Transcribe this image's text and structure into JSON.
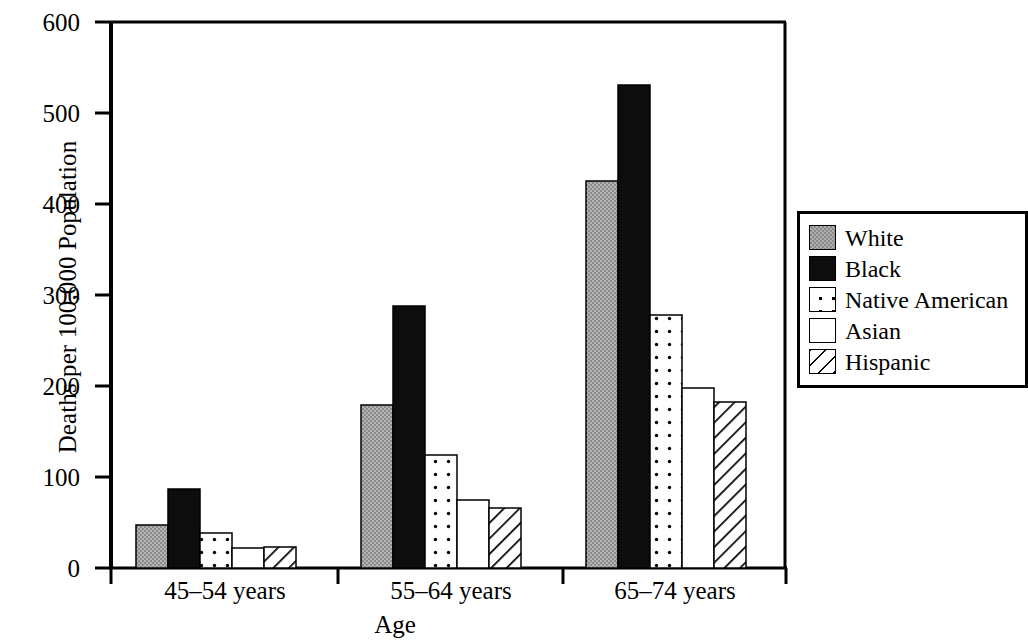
{
  "chart_data": {
    "type": "bar",
    "title": "",
    "xlabel": "Age",
    "ylabel": "Deaths per 100,000 Population",
    "categories": [
      "45–54 years",
      "55–64 years",
      "65–74 years"
    ],
    "ylim": [
      0,
      600
    ],
    "yticks": [
      0,
      100,
      200,
      300,
      400,
      500,
      600
    ],
    "ytick_labels": [
      "0",
      "100",
      "200",
      "300",
      "400",
      "500",
      "600"
    ],
    "grid": false,
    "legend_position": "right",
    "series": [
      {
        "name": "White",
        "pattern": "solid-gray",
        "color": "#8a8a8a",
        "values": [
          47,
          179,
          425
        ]
      },
      {
        "name": "Black",
        "pattern": "solid-black",
        "color": "#0d0d0d",
        "values": [
          87,
          288,
          531
        ]
      },
      {
        "name": "Native American",
        "pattern": "dotted",
        "color": "#ffffff",
        "values": [
          38,
          124,
          278
        ]
      },
      {
        "name": "Asian",
        "pattern": "empty",
        "color": "#ffffff",
        "values": [
          22,
          75,
          198
        ]
      },
      {
        "name": "Hispanic",
        "pattern": "diagonal-hatch",
        "color": "#ffffff",
        "values": [
          23,
          66,
          182
        ]
      }
    ]
  },
  "legend": {
    "items": [
      {
        "label": "White"
      },
      {
        "label": "Black"
      },
      {
        "label": "Native American"
      },
      {
        "label": "Asian"
      },
      {
        "label": "Hispanic"
      }
    ]
  },
  "axes": {
    "y_title": "Deaths per 100,000 Population",
    "x_title": "Age"
  }
}
